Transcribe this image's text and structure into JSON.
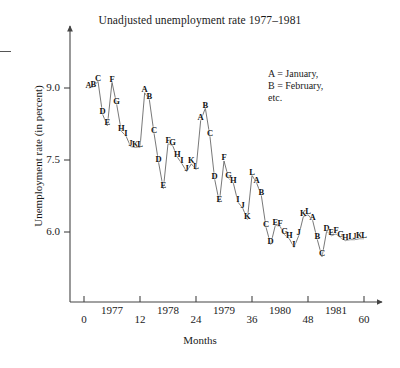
{
  "chart_data": {
    "type": "line",
    "title": "Unadjusted unemployment rate 1977–1981",
    "xlabel": "Months",
    "ylabel": "Unemployment rate (in percent)",
    "xlim": [
      -2,
      62
    ],
    "ylim": [
      5.1,
      9.4
    ],
    "grid": false,
    "legend_position": "upper-right",
    "legend_lines": [
      "A = January,",
      "B = February,",
      "etc."
    ],
    "point_labels_note": "Each plotted point is labeled by a letter denoting its month (A=January ... L=December).",
    "xticks": [
      0,
      12,
      24,
      36,
      48,
      60
    ],
    "xtick_labels": [
      "0",
      "12",
      "24",
      "36",
      "48",
      "60"
    ],
    "xyear_labels": [
      {
        "label": "1977",
        "x": 6
      },
      {
        "label": "1978",
        "x": 18
      },
      {
        "label": "1979",
        "x": 30
      },
      {
        "label": "1980",
        "x": 42
      },
      {
        "label": "1981",
        "x": 54
      }
    ],
    "yticks": [
      6.0,
      7.5,
      9.0
    ],
    "ytick_labels": [
      "6.0",
      "7.5",
      "9.0"
    ],
    "x": [
      1,
      2,
      3,
      4,
      5,
      6,
      7,
      8,
      9,
      10,
      11,
      12,
      13,
      14,
      15,
      16,
      17,
      18,
      19,
      20,
      21,
      22,
      23,
      24,
      25,
      26,
      27,
      28,
      29,
      30,
      31,
      32,
      33,
      34,
      35,
      36,
      37,
      38,
      39,
      40,
      41,
      42,
      43,
      44,
      45,
      46,
      47,
      48,
      49,
      50,
      51,
      52,
      53,
      54,
      55,
      56,
      57,
      58,
      59,
      60
    ],
    "letters": [
      "A",
      "B",
      "C",
      "D",
      "E",
      "F",
      "G",
      "H",
      "I",
      "J",
      "K",
      "L",
      "A",
      "B",
      "C",
      "D",
      "E",
      "F",
      "G",
      "H",
      "I",
      "J",
      "K",
      "L",
      "A",
      "B",
      "C",
      "D",
      "E",
      "F",
      "G",
      "H",
      "I",
      "J",
      "K",
      "L",
      "A",
      "B",
      "C",
      "D",
      "E",
      "F",
      "G",
      "H",
      "I",
      "J",
      "K",
      "L",
      "A",
      "B",
      "C",
      "D",
      "E",
      "F",
      "G",
      "H",
      "I",
      "J",
      "K",
      "L"
    ],
    "values": [
      9.0,
      9.02,
      9.14,
      8.45,
      8.21,
      9.12,
      8.66,
      8.1,
      8.0,
      7.78,
      7.76,
      7.76,
      8.9,
      8.76,
      8.06,
      7.44,
      6.9,
      7.84,
      7.8,
      7.56,
      7.42,
      7.26,
      7.42,
      7.3,
      8.32,
      8.58,
      7.98,
      7.1,
      6.62,
      7.48,
      7.12,
      7.02,
      6.62,
      6.5,
      6.26,
      7.18,
      7.02,
      6.76,
      6.1,
      5.74,
      6.14,
      6.12,
      5.94,
      5.86,
      5.68,
      5.92,
      6.32,
      6.36,
      6.24,
      5.84,
      5.48,
      6.02,
      5.92,
      5.96,
      5.88,
      5.82,
      5.84,
      5.84,
      5.86,
      5.86
    ],
    "series_name": "Unadjusted unemployment rate"
  }
}
